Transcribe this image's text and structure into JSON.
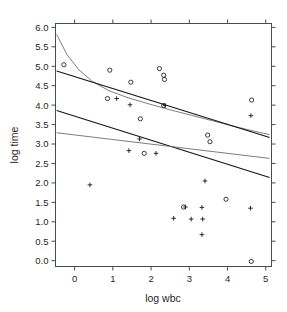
{
  "chart_data": {
    "type": "scatter",
    "title": "",
    "xlabel": "log wbc",
    "ylabel": "log time",
    "xlim": [
      -0.5,
      5.15
    ],
    "ylim": [
      -0.15,
      6.1
    ],
    "xticks": [
      0,
      1,
      2,
      3,
      4,
      5
    ],
    "xticklabels": [
      "0",
      "1",
      "2",
      "3",
      "4",
      "5"
    ],
    "yticks": [
      0.0,
      0.5,
      1.0,
      1.5,
      2.0,
      2.5,
      3.0,
      3.5,
      4.0,
      4.5,
      5.0,
      5.5,
      6.0
    ],
    "yticklabels": [
      "0.0",
      "0.5",
      "1.0",
      "1.5",
      "2.0",
      "2.5",
      "3.0",
      "3.5",
      "4.0",
      "4.5",
      "5.0",
      "5.5",
      "6.0"
    ],
    "grid": false,
    "legend": null,
    "series": [
      {
        "name": "circle-group",
        "marker": "circle",
        "points": [
          [
            -0.28,
            5.04
          ],
          [
            0.92,
            4.9
          ],
          [
            0.86,
            4.17
          ],
          [
            1.47,
            4.59
          ],
          [
            1.72,
            3.65
          ],
          [
            1.82,
            2.76
          ],
          [
            2.22,
            4.94
          ],
          [
            2.33,
            4.77
          ],
          [
            2.35,
            4.66
          ],
          [
            2.33,
            3.99
          ],
          [
            3.48,
            3.23
          ],
          [
            3.54,
            3.06
          ],
          [
            2.85,
            1.38
          ],
          [
            3.96,
            1.58
          ],
          [
            4.63,
            4.13
          ],
          [
            4.62,
            -0.02
          ]
        ]
      },
      {
        "name": "plus-group",
        "marker": "plus",
        "points": [
          [
            0.4,
            1.95
          ],
          [
            1.1,
            4.17
          ],
          [
            1.45,
            4.01
          ],
          [
            1.7,
            3.13
          ],
          [
            1.42,
            2.83
          ],
          [
            2.13,
            2.76
          ],
          [
            2.37,
            3.99
          ],
          [
            2.9,
            1.38
          ],
          [
            3.33,
            1.37
          ],
          [
            3.05,
            1.07
          ],
          [
            3.35,
            1.07
          ],
          [
            3.33,
            0.67
          ],
          [
            2.59,
            1.09
          ],
          [
            3.41,
            2.05
          ],
          [
            4.6,
            1.35
          ],
          [
            4.61,
            3.73
          ]
        ]
      }
    ],
    "fit_lines": [
      {
        "name": "upper-curve",
        "style": "light",
        "type": "curve",
        "points": [
          [
            -0.47,
            5.82
          ],
          [
            -0.2,
            5.3
          ],
          [
            0.1,
            4.92
          ],
          [
            0.45,
            4.62
          ],
          [
            0.9,
            4.37
          ],
          [
            1.4,
            4.19
          ],
          [
            1.95,
            4.03
          ],
          [
            2.5,
            3.88
          ],
          [
            3.05,
            3.74
          ],
          [
            3.6,
            3.6
          ],
          [
            4.15,
            3.46
          ],
          [
            4.7,
            3.33
          ],
          [
            5.1,
            3.24
          ]
        ]
      },
      {
        "name": "upper-regression-line",
        "style": "dark",
        "type": "line",
        "points": [
          [
            -0.47,
            4.88
          ],
          [
            5.1,
            3.17
          ]
        ]
      },
      {
        "name": "lower-regression-line",
        "style": "dark",
        "type": "line",
        "points": [
          [
            -0.47,
            3.86
          ],
          [
            5.1,
            2.14
          ]
        ]
      },
      {
        "name": "lower-flat-line",
        "style": "light",
        "type": "line",
        "points": [
          [
            -0.47,
            3.29
          ],
          [
            5.1,
            2.63
          ]
        ]
      }
    ]
  }
}
